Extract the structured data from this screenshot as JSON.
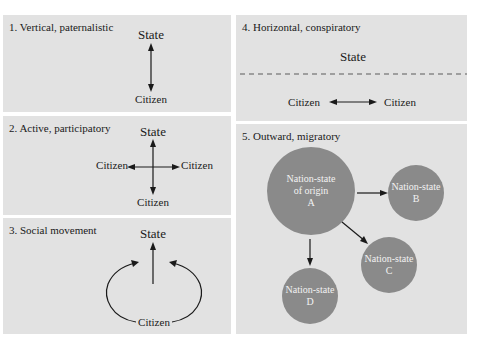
{
  "colors": {
    "panel_bg": "#e2e2e2",
    "circle_fill": "#8a8a8a",
    "arrow": "#1a1a1a",
    "dashed_line": "#888888",
    "circle_text": "#f2f2f2"
  },
  "panels": [
    {
      "id": 1,
      "title": "1. Vertical, paternalistic",
      "labels": {
        "top": "State",
        "bottom": "Citizen"
      },
      "arrows": "bidirectional-vertical"
    },
    {
      "id": 2,
      "title": "2. Active, participatory",
      "labels": {
        "top": "State",
        "left": "Citizen",
        "right": "Citizen",
        "bottom": "Citizen"
      },
      "arrows": "cross-four-way"
    },
    {
      "id": 3,
      "title": "3. Social movement",
      "labels": {
        "top": "State",
        "bottom": "Citizen"
      },
      "arrows": "upward-with-circling-arrows"
    },
    {
      "id": 4,
      "title": "4. Horizontal, conspiratory",
      "labels": {
        "top": "State",
        "left": "Citizen",
        "right": "Citizen"
      },
      "arrows": "bidirectional-horizontal-below-dashed-line"
    },
    {
      "id": 5,
      "title": "5. Outward, migratory",
      "nodes": [
        {
          "id": "A",
          "line1": "Nation-state",
          "line2": "of origin",
          "line3": "A"
        },
        {
          "id": "B",
          "line1": "Nation-state",
          "line2": "B"
        },
        {
          "id": "C",
          "line1": "Nation-state",
          "line2": "C"
        },
        {
          "id": "D",
          "line1": "Nation-state",
          "line2": "D"
        }
      ],
      "edges": [
        [
          "A",
          "B"
        ],
        [
          "A",
          "C"
        ],
        [
          "A",
          "D"
        ]
      ]
    }
  ]
}
